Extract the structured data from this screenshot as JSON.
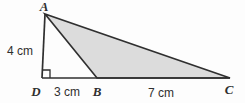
{
  "figure": {
    "type": "geometry-diagram",
    "shaded_region": "triangle ABC",
    "right_angle_at": "D",
    "colors": {
      "line": "#2f2f2f",
      "shade_fill": "#dcdcdc",
      "background": "#fdfdfd",
      "text": "#2f2f2f"
    },
    "vertices": {
      "A": {
        "label": "A",
        "x": 45,
        "y": 14
      },
      "B": {
        "label": "B",
        "x": 97,
        "y": 78
      },
      "C": {
        "label": "C",
        "x": 230,
        "y": 78
      },
      "D": {
        "label": "D",
        "x": 42,
        "y": 78
      }
    },
    "measurements": [
      {
        "segment": "AD",
        "label": "4 cm"
      },
      {
        "segment": "DB",
        "label": "3 cm"
      },
      {
        "segment": "BC",
        "label": "7 cm"
      }
    ]
  }
}
